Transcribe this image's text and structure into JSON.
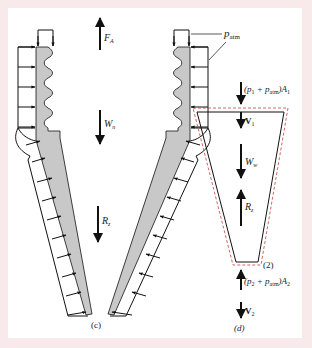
{
  "figure": {
    "background_color": "#f8eaea",
    "panel_color": "#ffffff",
    "wall_fill_color": "#c8c8c8",
    "cv_dashed_color": "#c04040",
    "line_color": "#111111"
  },
  "panel_c": {
    "caption": "(c)",
    "labels": {
      "anchor_force": "F",
      "anchor_force_sub": "A",
      "nozzle_weight": "W",
      "nozzle_weight_sub": "n",
      "reaction": "R",
      "reaction_sub": "z",
      "atm_pressure": "p",
      "atm_pressure_sub": "atm"
    },
    "arrows": {
      "anchor_force_direction": "up",
      "nozzle_weight_direction": "down",
      "reaction_direction": "down"
    }
  },
  "panel_d": {
    "caption": "(d)",
    "section_label": "(2)",
    "labels": {
      "inlet_force": "(p",
      "inlet_force_sub1": "1",
      "inlet_force_mid": " + p",
      "inlet_force_sub2": "atm",
      "inlet_force_end": ")A",
      "inlet_force_sub3": "1",
      "inlet_velocity": "V",
      "inlet_velocity_sub": "1",
      "water_weight": "W",
      "water_weight_sub": "w",
      "reaction": "R",
      "reaction_sub": "z",
      "outlet_force": "(p",
      "outlet_force_sub1": "2",
      "outlet_force_mid": " + p",
      "outlet_force_sub2": "atm",
      "outlet_force_end": ")A",
      "outlet_force_sub3": "2",
      "outlet_velocity": "V",
      "outlet_velocity_sub": "2"
    },
    "arrows": {
      "inlet_force_direction": "down",
      "inlet_velocity_direction": "down",
      "water_weight_direction": "down",
      "reaction_direction": "up",
      "outlet_force_direction": "up",
      "outlet_velocity_direction": "down"
    }
  }
}
